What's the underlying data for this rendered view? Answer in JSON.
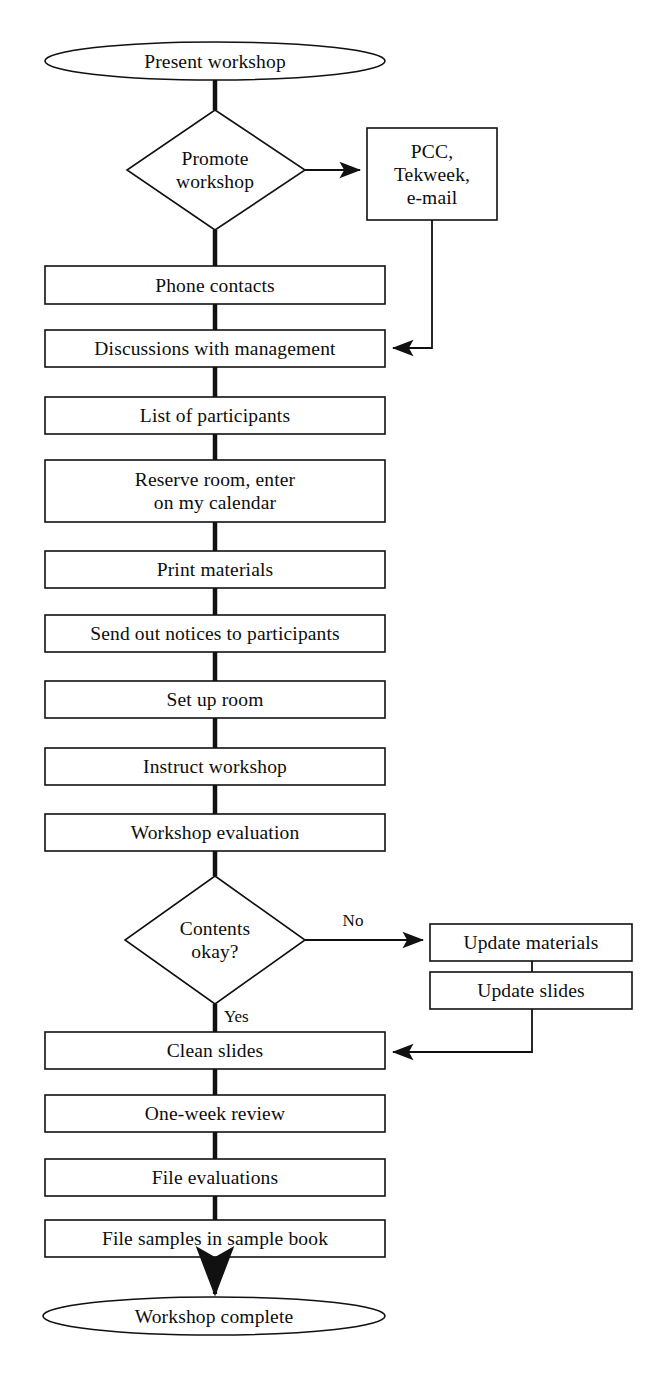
{
  "diagram": {
    "stroke_color": "#111111",
    "background_color": "#ffffff",
    "nodes": [
      {
        "id": "start",
        "shape": "ellipse",
        "label": "Present workshop"
      },
      {
        "id": "promote",
        "shape": "diamond",
        "label": "Promote\nworkshop"
      },
      {
        "id": "channels",
        "shape": "rect",
        "label": "PCC,\nTekweek,\ne-mail"
      },
      {
        "id": "phone",
        "shape": "rect",
        "label": "Phone contacts"
      },
      {
        "id": "discussions",
        "shape": "rect",
        "label": "Discussions with management"
      },
      {
        "id": "participants",
        "shape": "rect",
        "label": "List of participants"
      },
      {
        "id": "reserve",
        "shape": "rect",
        "label": "Reserve room, enter\non my calendar"
      },
      {
        "id": "print",
        "shape": "rect",
        "label": "Print materials"
      },
      {
        "id": "notices",
        "shape": "rect",
        "label": "Send out notices to participants"
      },
      {
        "id": "setup",
        "shape": "rect",
        "label": "Set up room"
      },
      {
        "id": "instruct",
        "shape": "rect",
        "label": "Instruct workshop"
      },
      {
        "id": "evaluation",
        "shape": "rect",
        "label": "Workshop evaluation"
      },
      {
        "id": "contents",
        "shape": "diamond",
        "label": "Contents\nokay?"
      },
      {
        "id": "updatemat",
        "shape": "rect",
        "label": "Update materials"
      },
      {
        "id": "updateslides",
        "shape": "rect",
        "label": "Update slides"
      },
      {
        "id": "clean",
        "shape": "rect",
        "label": "Clean slides"
      },
      {
        "id": "review",
        "shape": "rect",
        "label": "One-week review"
      },
      {
        "id": "fileeval",
        "shape": "rect",
        "label": "File evaluations"
      },
      {
        "id": "filesamples",
        "shape": "rect",
        "label": "File samples in sample book"
      },
      {
        "id": "end",
        "shape": "ellipse",
        "label": "Workshop complete"
      }
    ],
    "edge_labels": {
      "no": "No",
      "yes": "Yes"
    }
  }
}
